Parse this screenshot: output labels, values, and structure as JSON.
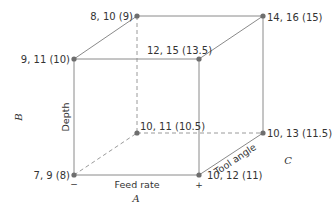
{
  "diagram": {
    "type": "cube-plot",
    "colors": {
      "edge": "#8a8a8a",
      "dashed_edge": "#9a9a9a",
      "vertex": "#6e6e6e",
      "text": "#333333"
    },
    "vertices": [
      {
        "id": "front-bottom-left",
        "label": "7, 9 (8)"
      },
      {
        "id": "front-bottom-right",
        "label": "10, 12 (11)"
      },
      {
        "id": "front-top-left",
        "label": "9, 11 (10)"
      },
      {
        "id": "front-top-right",
        "label": "12, 15 (13.5)"
      },
      {
        "id": "back-bottom-left",
        "label": "10, 11 (10.5)"
      },
      {
        "id": "back-bottom-right",
        "label": "10, 13 (11.5)"
      },
      {
        "id": "back-top-left",
        "label": "8, 10 (9)"
      },
      {
        "id": "back-top-right",
        "label": "14, 16 (15)"
      }
    ],
    "axes": {
      "feed_rate": {
        "label": "Feed rate",
        "factor": "A",
        "low_sign": "−",
        "high_sign": "+"
      },
      "depth": {
        "label": "Depth",
        "factor": "B"
      },
      "tool_angle": {
        "label": "Tool angle",
        "factor": "C"
      }
    }
  }
}
